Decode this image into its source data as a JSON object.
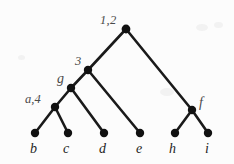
{
  "figure": {
    "type": "rooted-binary-tree-diagram",
    "background_color": "#fcfcfc",
    "edge_color": "#1a1a1a",
    "node_color": "#111111",
    "label_color": "#2b2b2b"
  },
  "nodes": {
    "root": {
      "label": "1,2",
      "x": 126,
      "y": 29,
      "kind": "internal"
    },
    "n3": {
      "label": "3",
      "x": 88,
      "y": 70,
      "kind": "internal"
    },
    "g": {
      "label": "g",
      "x": 71,
      "y": 88,
      "kind": "internal"
    },
    "a4": {
      "label": "a,4",
      "x": 55,
      "y": 107,
      "kind": "internal"
    },
    "f": {
      "label": "f",
      "x": 192,
      "y": 110,
      "kind": "internal"
    },
    "b": {
      "label": "b",
      "x": 35,
      "y": 133,
      "kind": "leaf"
    },
    "c": {
      "label": "c",
      "x": 68,
      "y": 133,
      "kind": "leaf"
    },
    "d": {
      "label": "d",
      "x": 104,
      "y": 133,
      "kind": "leaf"
    },
    "e": {
      "label": "e",
      "x": 140,
      "y": 133,
      "kind": "leaf"
    },
    "h": {
      "label": "h",
      "x": 175,
      "y": 133,
      "kind": "leaf"
    },
    "i": {
      "label": "i",
      "x": 208,
      "y": 133,
      "kind": "leaf"
    }
  },
  "edges": [
    {
      "from": "root",
      "to": "n3"
    },
    {
      "from": "root",
      "to": "f"
    },
    {
      "from": "n3",
      "to": "g"
    },
    {
      "from": "n3",
      "to": "e"
    },
    {
      "from": "g",
      "to": "a4"
    },
    {
      "from": "g",
      "to": "d"
    },
    {
      "from": "a4",
      "to": "b"
    },
    {
      "from": "a4",
      "to": "c"
    },
    {
      "from": "f",
      "to": "h"
    },
    {
      "from": "f",
      "to": "i"
    }
  ],
  "labels": {
    "root": "1,2",
    "n3": "3",
    "g": "g",
    "a4": "a,4",
    "f": "f",
    "b": "b",
    "c": "c",
    "d": "d",
    "e": "e",
    "h": "h",
    "i": "i"
  }
}
